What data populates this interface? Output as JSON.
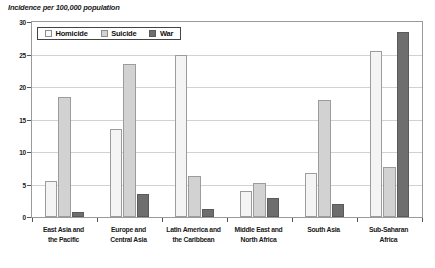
{
  "chart_data": {
    "type": "bar",
    "title": "Incidence per 100,000 population",
    "xlabel": "",
    "ylabel": "",
    "ylim": [
      0,
      30
    ],
    "yticks": [
      0,
      5,
      10,
      15,
      20,
      25,
      30
    ],
    "grid": true,
    "legend_position": "top-left-inside",
    "categories": [
      "East Asia and the Pacific",
      "Europe and Central Asia",
      "Latin America and the Caribbean",
      "Middle East and North Africa",
      "South Asia",
      "Sub-Saharan Africa"
    ],
    "category_lines": [
      [
        "East Asia and",
        "the Pacific"
      ],
      [
        "Europe and",
        "Central Asia"
      ],
      [
        "Latin America and",
        "the Caribbean"
      ],
      [
        "Middle East and",
        "North Africa"
      ],
      [
        "South Asia",
        ""
      ],
      [
        "Sub-Saharan",
        "Africa"
      ]
    ],
    "series": [
      {
        "name": "Homicide",
        "color": "#f4f4f4",
        "values": [
          5.5,
          13.5,
          25.0,
          4.0,
          6.8,
          25.5
        ]
      },
      {
        "name": "Suicide",
        "color": "#d2d2d2",
        "values": [
          18.5,
          23.5,
          6.3,
          5.3,
          18.0,
          7.7
        ]
      },
      {
        "name": "War",
        "color": "#6e6e6e",
        "values": [
          0.7,
          3.5,
          1.3,
          3.0,
          2.0,
          28.5
        ]
      }
    ]
  },
  "legend": {
    "items": [
      {
        "label": "Homicide",
        "key": "homicide"
      },
      {
        "label": "Suicide",
        "key": "suicide"
      },
      {
        "label": "War",
        "key": "war"
      }
    ]
  }
}
